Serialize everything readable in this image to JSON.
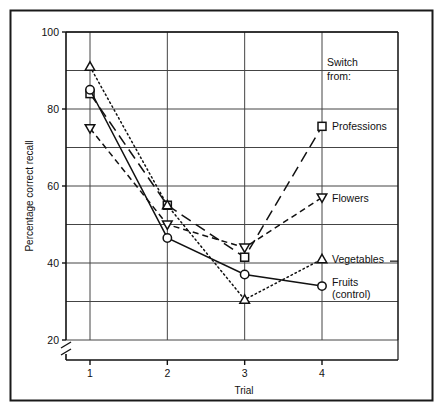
{
  "chart_data": {
    "type": "line",
    "title": "",
    "xlabel": "Trial",
    "ylabel": "Percentage correct recall",
    "x": [
      1,
      2,
      3,
      4
    ],
    "xtick_labels": [
      "1",
      "2",
      "3",
      "4"
    ],
    "ytick_labels": [
      "20",
      "40",
      "60",
      "80",
      "100"
    ],
    "ytick_values": [
      20,
      40,
      60,
      80,
      100
    ],
    "yminor_values": [
      30,
      50,
      70,
      90
    ],
    "xlim": [
      1,
      4
    ],
    "ylim": [
      20,
      100
    ],
    "grid": true,
    "axis_break": true,
    "legend_position": "right",
    "legend_title": "Switch from:",
    "series": [
      {
        "name": "Professions",
        "marker": "square",
        "line_style": "long-dash",
        "values": [
          84,
          55,
          41.5,
          75.5
        ]
      },
      {
        "name": "Flowers",
        "marker": "triangle-down",
        "line_style": "dash",
        "values": [
          75,
          50,
          44,
          57
        ]
      },
      {
        "name": "Vegetables",
        "marker": "triangle-up",
        "line_style": "dotted",
        "values": [
          91,
          55,
          30.5,
          41
        ]
      },
      {
        "name": "Fruits (control)",
        "marker": "circle",
        "line_style": "solid",
        "values": [
          85,
          46.5,
          37,
          34
        ]
      }
    ]
  },
  "annotations": {
    "switch_line1": "Switch",
    "switch_line2": "from:"
  },
  "legend": {
    "items": [
      {
        "label": "Professions",
        "marker": "square"
      },
      {
        "label": "Flowers",
        "marker": "triangle-down"
      },
      {
        "label": "Vegetables",
        "marker": "triangle-up"
      },
      {
        "label_line1": "Fruits",
        "label_line2": "(control)",
        "marker": "circle"
      }
    ]
  },
  "colors": {
    "ink": "#111111",
    "grid": "#444444",
    "background": "#ffffff",
    "frame": "#1a1a1a"
  }
}
